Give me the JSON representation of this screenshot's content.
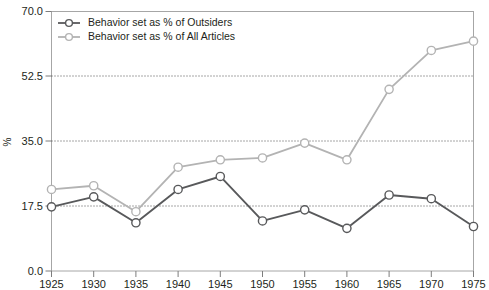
{
  "chart_data": {
    "type": "line",
    "title": "",
    "subtitle": "",
    "xlabel": "",
    "ylabel": "%",
    "categories": [
      "1925",
      "1930",
      "1935",
      "1940",
      "1945",
      "1950",
      "1955",
      "1960",
      "1965",
      "1970",
      "1975"
    ],
    "x": [
      1925,
      1930,
      1935,
      1940,
      1945,
      1950,
      1955,
      1960,
      1965,
      1970,
      1975
    ],
    "xlim": [
      1925,
      1975
    ],
    "ylim": [
      0.0,
      70.0
    ],
    "yticks": [
      "0.0",
      "17.5",
      "35.0",
      "52.5",
      "70.0"
    ],
    "ytick_values": [
      0.0,
      17.5,
      35.0,
      52.5,
      70.0
    ],
    "xticks": [
      "1925",
      "1930",
      "1935",
      "1940",
      "1945",
      "1950",
      "1955",
      "1960",
      "1965",
      "1970",
      "1975"
    ],
    "grid": "horizontal-dotted",
    "legend_position": "top-left-inside",
    "series": [
      {
        "name": "Behavior set as % of Outsiders",
        "color": "#58595b",
        "marker": "open-circle",
        "values": [
          17.3,
          20.0,
          13.0,
          22.0,
          25.5,
          13.5,
          16.5,
          11.5,
          20.5,
          19.5,
          12.0
        ]
      },
      {
        "name": "Behavior set as % of All Articles",
        "color": "#b3b3b3",
        "marker": "open-circle",
        "values": [
          22.0,
          23.0,
          16.0,
          28.0,
          30.0,
          30.5,
          34.5,
          30.0,
          49.0,
          59.5,
          62.0
        ]
      }
    ],
    "annotations": []
  },
  "legend": {
    "entries": [
      {
        "label": "Behavior set as % of Outsiders",
        "color": "#58595b"
      },
      {
        "label": "Behavior set as % of All Articles",
        "color": "#b3b3b3"
      }
    ]
  },
  "axes": {
    "y_axis_title": "%",
    "y_tick_labels": [
      "70.0",
      "52.5",
      "35.0",
      "17.5",
      "0.0"
    ],
    "x_tick_labels": [
      "1925",
      "1930",
      "1935",
      "1940",
      "1945",
      "1950",
      "1955",
      "1960",
      "1965",
      "1970",
      "1975"
    ]
  },
  "colors": {
    "series_dark": "#58595b",
    "series_light": "#b3b3b3",
    "frame": "#a6a6a6",
    "grid": "#3b3b3b",
    "text": "#231f20",
    "background": "#ffffff"
  }
}
